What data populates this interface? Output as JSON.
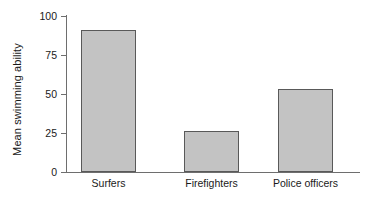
{
  "chart_data": {
    "type": "bar",
    "title": "",
    "subtitle": "",
    "xlabel": "",
    "ylabel": "Mean swimming ability",
    "categories": [
      "Surfers",
      "Firefighters",
      "Police officers"
    ],
    "values": [
      91,
      26,
      53
    ],
    "series": [
      {
        "name": "Mean swimming ability",
        "values": [
          91,
          26,
          53
        ]
      }
    ],
    "ylim": [
      0,
      100
    ],
    "y_ticks": [
      0,
      25,
      50,
      75,
      100
    ],
    "y_tick_labels": [
      "0",
      "25",
      "50",
      "75",
      "100"
    ],
    "x_ticks": [
      "Surfers",
      "Firefighters",
      "Police officers"
    ],
    "grid": false,
    "legend": false,
    "legend_position": "none",
    "bar_fill_color": "#c3c3c3",
    "bar_border_color": "#595959",
    "axis_color": "#6e6e6e",
    "text_color": "#1a1a1a",
    "background_color": "#ffffff",
    "annotations": []
  },
  "axis": {
    "y_label": "Mean swimming ability",
    "ticks": [
      {
        "label": "100",
        "value": 100
      },
      {
        "label": "75",
        "value": 75
      },
      {
        "label": "50",
        "value": 50
      },
      {
        "label": "25",
        "value": 25
      },
      {
        "label": "0",
        "value": 0
      }
    ]
  },
  "bars": [
    {
      "label": "Surfers",
      "value": 91
    },
    {
      "label": "Firefighters",
      "value": 26
    },
    {
      "label": "Police officers",
      "value": 53
    }
  ]
}
